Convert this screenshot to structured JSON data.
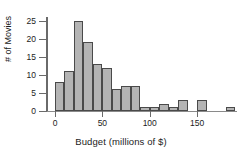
{
  "chart_data": {
    "type": "bar",
    "title": "",
    "subtitle": "",
    "xlabel": "Budget (millions of $)",
    "ylabel": "# of Movies",
    "bin_width": 10,
    "bin_starts": [
      0,
      10,
      20,
      30,
      40,
      50,
      60,
      70,
      80,
      90,
      100,
      110,
      120,
      130,
      140,
      150,
      160,
      170,
      180
    ],
    "categories": [
      "0-10",
      "10-20",
      "20-30",
      "30-40",
      "40-50",
      "50-60",
      "60-70",
      "70-80",
      "80-90",
      "90-100",
      "100-110",
      "110-120",
      "120-130",
      "130-140",
      "140-150",
      "150-160",
      "160-170",
      "170-180",
      "180-190"
    ],
    "values": [
      8,
      11,
      25,
      19,
      13,
      12,
      6,
      7,
      7,
      1,
      1,
      2,
      1,
      3,
      0,
      3,
      0,
      0,
      1
    ],
    "xlim": [
      0,
      190
    ],
    "ylim": [
      0,
      26
    ],
    "xticks": [
      0,
      50,
      100,
      150
    ],
    "xticklabels": [
      "0",
      "50",
      "100",
      "150"
    ],
    "yticks": [
      0,
      5,
      10,
      15,
      20,
      25
    ],
    "yticklabels": [
      "0",
      "5",
      "10",
      "15",
      "20",
      "25"
    ],
    "grid": false,
    "legend": null,
    "bar_fill_color": "#b4b4b4",
    "bar_edge_color": "#4a4a4a",
    "axis_color": "#6a6a6a",
    "text_color": "#1c1c1c"
  }
}
